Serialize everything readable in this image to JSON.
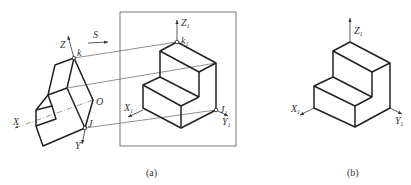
{
  "figure_a": {
    "caption": "(a)",
    "left_labels": {
      "z": "Z",
      "x": "X",
      "y": "Y",
      "o": "O",
      "k": "k",
      "j": "J",
      "s": "S"
    },
    "right_labels": {
      "z": "Z",
      "x": "X",
      "y": "Y",
      "k": "k",
      "j": "J",
      "subscript": "1"
    }
  },
  "figure_b": {
    "caption": "(b)",
    "labels": {
      "z": "Z",
      "x": "X",
      "y": "Y",
      "subscript": "1"
    }
  }
}
